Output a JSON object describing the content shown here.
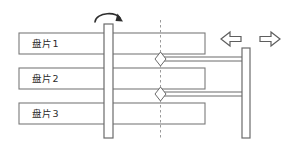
{
  "figure": {
    "type": "hard-disk-drive-schematic",
    "width": 287,
    "height": 149,
    "background_color": "#ffffff",
    "line_color": "#6b6b6b",
    "dark_line_color": "#3a3a3a",
    "dashed_line_color": "#8a8a8a",
    "fill_color": "#ffffff",
    "text_color": "#2b2b2b"
  },
  "platters": [
    {
      "label": "盘片1",
      "x": 19,
      "y": 33,
      "width": 186,
      "height": 21,
      "label_x": 32,
      "label_y": 44
    },
    {
      "label": "盘片2",
      "x": 19,
      "y": 68,
      "width": 186,
      "height": 21,
      "label_x": 32,
      "label_y": 79
    },
    {
      "label": "盘片3",
      "x": 19,
      "y": 103,
      "width": 186,
      "height": 21,
      "label_x": 32,
      "label_y": 114
    }
  ],
  "spindle": {
    "name": "spindle-shaft",
    "x": 104,
    "y": 24,
    "width": 9,
    "height": 114
  },
  "rotation_arrow": {
    "name": "rotation-arrow",
    "path": "M 96 21 C 98 13, 116 13, 119 20",
    "arrow_points": "119,14 122,22 115,21"
  },
  "centerline": {
    "name": "head-centerline",
    "x": 160,
    "y_top": 20,
    "y_bottom": 140,
    "dash": "2.5,2.5"
  },
  "actuator_post": {
    "name": "actuator-post",
    "x": 242,
    "y": 48,
    "width": 8,
    "height": 90
  },
  "arms": [
    {
      "name": "actuator-arm-upper",
      "x": 160,
      "y": 57,
      "width": 84,
      "height": 4
    },
    {
      "name": "actuator-arm-lower",
      "x": 160,
      "y": 92,
      "width": 84,
      "height": 4
    }
  ],
  "heads": [
    {
      "name": "read-write-head-upper",
      "cx": 160,
      "cy": 59,
      "rx": 5.5,
      "ry": 7
    },
    {
      "name": "read-write-head-lower",
      "cx": 160,
      "cy": 94,
      "rx": 5.5,
      "ry": 7
    }
  ],
  "seek_arrows": {
    "name": "seek-direction-arrows",
    "left": {
      "name": "seek-arrow-left",
      "points": "222,39 230,33 230,36.5 240,36.5 240,41.5 230,41.5 230,45"
    },
    "right": {
      "name": "seek-arrow-right",
      "points": "279,39 271,33 271,36.5 251,36.5 251,41.5 271,41.5 271,45"
    }
  }
}
